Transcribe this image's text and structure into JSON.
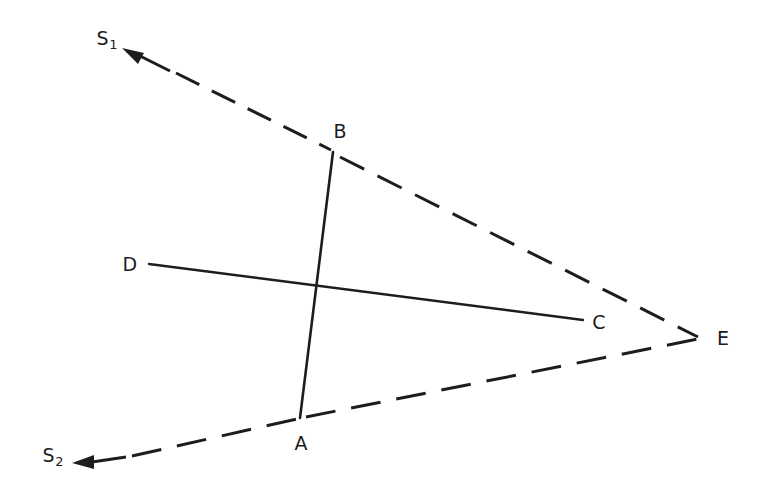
{
  "figure": {
    "background_color": "#ffffff",
    "ink_color": "#1d1d1f",
    "width": 772,
    "height": 501
  },
  "labels": {
    "s1": {
      "text": "S",
      "subscript": "1",
      "x": 107,
      "y": 40
    },
    "s2": {
      "text": "S",
      "subscript": "2",
      "x": 53,
      "y": 457
    },
    "a": {
      "text": "A",
      "x": 301,
      "y": 443
    },
    "b": {
      "text": "B",
      "x": 340,
      "y": 131
    },
    "c": {
      "text": "C",
      "x": 599,
      "y": 322
    },
    "d": {
      "text": "D",
      "x": 130,
      "y": 264
    },
    "e": {
      "text": "E",
      "x": 723,
      "y": 338
    }
  },
  "geometry": {
    "points": {
      "A": {
        "x": 300,
        "y": 418
      },
      "B": {
        "x": 333,
        "y": 152
      },
      "C": {
        "x": 583,
        "y": 320
      },
      "D": {
        "x": 149,
        "y": 264
      },
      "E": {
        "x": 700,
        "y": 338
      },
      "S1_tip": {
        "x": 122,
        "y": 48
      },
      "S2_tip": {
        "x": 72,
        "y": 463
      },
      "intersection_AB_DC": {
        "x": 317,
        "y": 288
      }
    },
    "edges": [
      {
        "name": "ray-s1-upper-dashed",
        "from": "S1_tip",
        "to": "E",
        "style": "dashed",
        "arrow": "start"
      },
      {
        "name": "ray-s2-lower-dashed",
        "from": "S2_tip",
        "to": "E",
        "style": "dashed",
        "arrow": "start"
      },
      {
        "name": "segment-ab-solid",
        "from": "B",
        "to": "A",
        "style": "solid",
        "arrow": "none"
      },
      {
        "name": "segment-dc-solid",
        "from": "D",
        "to": "C",
        "style": "solid",
        "arrow": "none"
      }
    ],
    "stroke_width_solid": 2.6,
    "stroke_width_dashed": 3.0,
    "dash_pattern_upper": "26 14",
    "dash_pattern_lower": "30 16"
  }
}
